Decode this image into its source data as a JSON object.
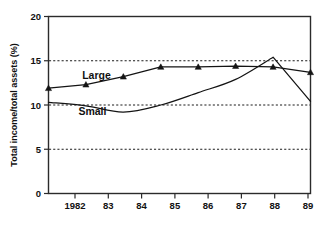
{
  "chart_data": {
    "type": "line",
    "title": "",
    "xlabel": "",
    "ylabel": "Total income/total assets (%)",
    "x": [
      1982,
      1983,
      1984,
      1985,
      1986,
      1987,
      1988,
      1989
    ],
    "categories": [
      "1982",
      "83",
      "84",
      "85",
      "86",
      "87",
      "88",
      "89"
    ],
    "xlim": [
      1982,
      1989
    ],
    "ylim": [
      0,
      20
    ],
    "yticks": [
      0,
      5,
      10,
      15,
      20
    ],
    "ytick_labels": [
      "0",
      "5",
      "10",
      "15",
      "20"
    ],
    "gridlines_y": [
      5,
      10,
      15
    ],
    "grid": "horizontal-dashed",
    "legend": "inline-labels",
    "series": [
      {
        "name": "Large",
        "label": "Large",
        "marker": "triangle",
        "values": [
          11.9,
          12.3,
          13.2,
          14.3,
          14.3,
          14.4,
          14.3,
          13.7
        ]
      },
      {
        "name": "Small",
        "label": "Small",
        "marker": "none",
        "values": [
          10.3,
          9.9,
          9.2,
          10.0,
          11.4,
          12.9,
          15.4,
          10.4
        ]
      }
    ],
    "annotations": [
      {
        "text": "Large",
        "x": 1982.9,
        "y": 12.9
      },
      {
        "text": "Small",
        "x": 1982.8,
        "y": 8.9
      }
    ],
    "colors": {
      "line": "#141414",
      "grid": "#1a1a1a",
      "frame": "#2b2b2b",
      "background": "#ffffff",
      "text": "#111111"
    }
  }
}
